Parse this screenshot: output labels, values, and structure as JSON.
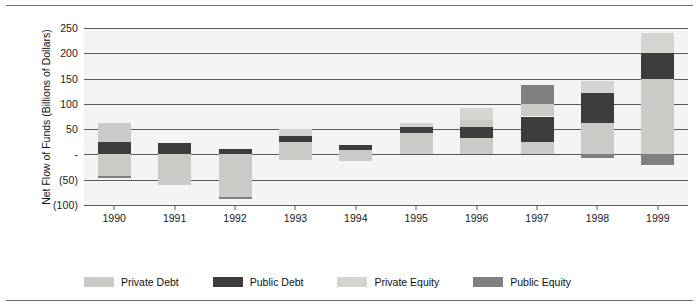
{
  "chart_data": {
    "type": "bar",
    "title": "",
    "subtitle": "",
    "xlabel": "",
    "ylabel": "Net Flow of Funds (Billions of Dollars)",
    "categories": [
      "1990",
      "1991",
      "1992",
      "1993",
      "1994",
      "1995",
      "1996",
      "1997",
      "1998",
      "1999"
    ],
    "ylim": [
      -100,
      250
    ],
    "yticks": [
      250,
      200,
      150,
      100,
      50,
      0,
      -50,
      -100
    ],
    "ytick_labels": [
      "250",
      "200",
      "150",
      "100",
      "50",
      "-",
      "(50)",
      "(100)"
    ],
    "grid": true,
    "stacked": true,
    "legend_position": "bottom",
    "series": [
      {
        "name": "Private Debt",
        "color": "#cccac6",
        "values": [
          19,
          -60,
          -85,
          13,
          -21,
          42,
          46,
          75,
          62,
          150
        ]
      },
      {
        "name": "Public Debt",
        "color": "#3d3d3d",
        "values": [
          25,
          22,
          10,
          12,
          10,
          13,
          22,
          50,
          60,
          50
        ]
      },
      {
        "name": "Private Equity",
        "color": "#d5d4d0",
        "values": [
          0,
          0,
          0,
          13,
          0,
          7,
          24,
          0,
          23,
          40
        ]
      },
      {
        "name": "Public Equity",
        "color": "#808080",
        "values": [
          -3,
          0,
          -3,
          0,
          0,
          0,
          0,
          37,
          -8,
          -20
        ]
      }
    ],
    "bars": [
      {
        "category": "1990",
        "total_positive": 62,
        "total_negative": -46,
        "segments": [
          {
            "series": "Private Debt",
            "from": 25,
            "to": 62
          },
          {
            "series": "Public Debt",
            "from": 0,
            "to": 25
          },
          {
            "series": "Private Debt",
            "from": -43,
            "to": 0
          },
          {
            "series": "Public Equity",
            "from": -46,
            "to": -43
          }
        ]
      },
      {
        "category": "1991",
        "total_positive": 22,
        "total_negative": -60,
        "segments": [
          {
            "series": "Public Debt",
            "from": 0,
            "to": 22
          },
          {
            "series": "Private Debt",
            "from": -60,
            "to": 0
          }
        ]
      },
      {
        "category": "1992",
        "total_positive": 10,
        "total_negative": -88,
        "segments": [
          {
            "series": "Public Debt",
            "from": 0,
            "to": 10
          },
          {
            "series": "Private Debt",
            "from": -85,
            "to": 0
          },
          {
            "series": "Public Equity",
            "from": -88,
            "to": -85
          }
        ]
      },
      {
        "category": "1993",
        "total_positive": 50,
        "total_negative": -12,
        "segments": [
          {
            "series": "Private Equity",
            "from": 37,
            "to": 50
          },
          {
            "series": "Public Debt",
            "from": 25,
            "to": 37
          },
          {
            "series": "Private Debt",
            "from": 0,
            "to": 25
          },
          {
            "series": "Private Debt",
            "from": -12,
            "to": 0
          }
        ]
      },
      {
        "category": "1994",
        "total_positive": 18,
        "total_negative": -13,
        "segments": [
          {
            "series": "Public Debt",
            "from": 8,
            "to": 18
          },
          {
            "series": "Private Debt",
            "from": -13,
            "to": 8
          }
        ]
      },
      {
        "category": "1995",
        "total_positive": 62,
        "total_negative": 0,
        "segments": [
          {
            "series": "Private Equity",
            "from": 55,
            "to": 62
          },
          {
            "series": "Public Debt",
            "from": 42,
            "to": 55
          },
          {
            "series": "Private Debt",
            "from": 0,
            "to": 42
          }
        ]
      },
      {
        "category": "1996",
        "total_positive": 92,
        "total_negative": 0,
        "segments": [
          {
            "series": "Private Equity",
            "from": 68,
            "to": 92
          },
          {
            "series": "Private Debt",
            "from": 55,
            "to": 68
          },
          {
            "series": "Public Debt",
            "from": 33,
            "to": 55
          },
          {
            "series": "Private Debt",
            "from": 0,
            "to": 33
          }
        ]
      },
      {
        "category": "1997",
        "total_positive": 137,
        "total_negative": 0,
        "segments": [
          {
            "series": "Public Equity",
            "from": 100,
            "to": 137
          },
          {
            "series": "Private Debt",
            "from": 75,
            "to": 100
          },
          {
            "series": "Public Debt",
            "from": 25,
            "to": 75
          },
          {
            "series": "Private Debt",
            "from": 0,
            "to": 25
          }
        ]
      },
      {
        "category": "1998",
        "total_positive": 145,
        "total_negative": -8,
        "segments": [
          {
            "series": "Private Equity",
            "from": 122,
            "to": 145
          },
          {
            "series": "Public Debt",
            "from": 62,
            "to": 122
          },
          {
            "series": "Private Debt",
            "from": 0,
            "to": 62
          },
          {
            "series": "Public Equity",
            "from": -8,
            "to": 0
          }
        ]
      },
      {
        "category": "1999",
        "total_positive": 240,
        "total_negative": -20,
        "segments": [
          {
            "series": "Private Equity",
            "from": 200,
            "to": 240
          },
          {
            "series": "Public Debt",
            "from": 150,
            "to": 200
          },
          {
            "series": "Private Debt",
            "from": 0,
            "to": 150
          },
          {
            "series": "Public Equity",
            "from": -20,
            "to": 0
          }
        ]
      }
    ]
  },
  "legend": {
    "items": [
      {
        "label": "Private Debt",
        "color": "#cccac6"
      },
      {
        "label": "Public Debt",
        "color": "#3d3d3d"
      },
      {
        "label": "Private Equity",
        "color": "#d5d4d0"
      },
      {
        "label": "Public Equity",
        "color": "#808080"
      }
    ]
  }
}
